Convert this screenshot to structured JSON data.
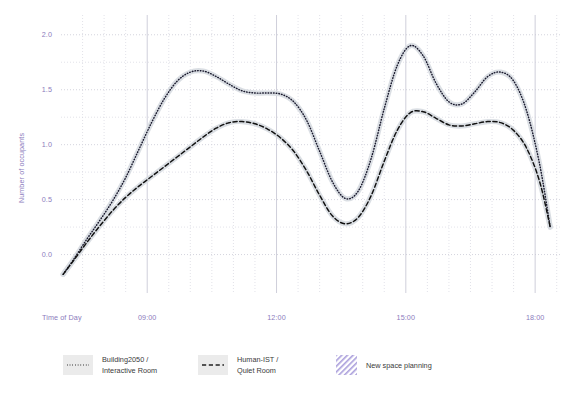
{
  "chart_data": {
    "type": "line",
    "title": "",
    "xlabel": "Time of Day",
    "ylabel": "Number of occupants",
    "xlim": [
      7.0,
      18.6
    ],
    "ylim": [
      -0.35,
      2.18
    ],
    "grid": true,
    "minor_grid": true,
    "xticks": [
      9,
      12,
      15,
      18
    ],
    "xtick_labels": [
      "09:00",
      "12:00",
      "15:00",
      "18:00"
    ],
    "yticks": [
      0.0,
      0.5,
      1.0,
      1.5,
      2.0
    ],
    "ytick_labels": [
      "0.0",
      "0.5",
      "1.0",
      "1.5",
      "2.0"
    ],
    "yticks_minor": [
      0.25,
      0.75,
      1.25,
      1.75
    ],
    "legend_position": "bottom",
    "band_color": "#d9dde3",
    "series": [
      {
        "name": "Building2050 /\nInteractive Room",
        "label_line1": "Building2050 /",
        "label_line2": "Interactive Room",
        "style": "dotted",
        "color": "#1a1a2e",
        "x": [
          7.05,
          7.3,
          7.6,
          7.9,
          8.2,
          8.5,
          8.8,
          9.1,
          9.4,
          9.7,
          10.0,
          10.3,
          10.6,
          10.9,
          11.2,
          11.5,
          11.8,
          12.1,
          12.4,
          12.7,
          13.0,
          13.3,
          13.6,
          13.9,
          14.2,
          14.5,
          14.8,
          15.1,
          15.4,
          15.7,
          16.0,
          16.3,
          16.6,
          16.9,
          17.2,
          17.5,
          17.8,
          18.1,
          18.35
        ],
        "y": [
          -0.18,
          -0.04,
          0.14,
          0.31,
          0.49,
          0.7,
          0.95,
          1.2,
          1.42,
          1.58,
          1.66,
          1.67,
          1.62,
          1.55,
          1.49,
          1.47,
          1.47,
          1.46,
          1.39,
          1.22,
          0.94,
          0.66,
          0.51,
          0.58,
          0.88,
          1.33,
          1.72,
          1.9,
          1.81,
          1.56,
          1.39,
          1.37,
          1.48,
          1.62,
          1.66,
          1.58,
          1.31,
          0.83,
          0.25
        ]
      },
      {
        "name": "Human-IST /\nQuiet Room",
        "label_line1": "Human-IST /",
        "label_line2": "Quiet Room",
        "style": "dashed",
        "color": "#111111",
        "x": [
          7.05,
          7.3,
          7.6,
          7.9,
          8.2,
          8.5,
          8.8,
          9.1,
          9.4,
          9.7,
          10.0,
          10.3,
          10.6,
          10.9,
          11.2,
          11.5,
          11.8,
          12.1,
          12.4,
          12.7,
          13.0,
          13.3,
          13.6,
          13.9,
          14.2,
          14.5,
          14.8,
          15.1,
          15.4,
          15.7,
          16.0,
          16.3,
          16.6,
          16.9,
          17.2,
          17.5,
          17.8,
          18.1,
          18.35
        ],
        "y": [
          -0.18,
          -0.05,
          0.11,
          0.26,
          0.4,
          0.52,
          0.62,
          0.71,
          0.8,
          0.89,
          0.98,
          1.07,
          1.15,
          1.2,
          1.21,
          1.19,
          1.14,
          1.06,
          0.94,
          0.76,
          0.54,
          0.35,
          0.28,
          0.34,
          0.54,
          0.85,
          1.13,
          1.29,
          1.3,
          1.24,
          1.18,
          1.17,
          1.19,
          1.21,
          1.2,
          1.13,
          0.97,
          0.67,
          0.25
        ]
      }
    ],
    "annotations": [
      {
        "name": "New space planning",
        "style": "hatched-swatch",
        "color": "#9b8fd4"
      }
    ]
  },
  "legend": {
    "items": [
      {
        "label_line1": "Building2050 /",
        "label_line2": "Interactive Room",
        "marker": "dotted-line-swatch"
      },
      {
        "label_line1": "Human-IST /",
        "label_line2": "Quiet Room",
        "marker": "dashed-line-swatch"
      },
      {
        "label_line1": "New space planning",
        "label_line2": "",
        "marker": "hatch-swatch"
      }
    ]
  },
  "colors": {
    "axis_text": "#8b7bbd",
    "grid": "#c9c9d6",
    "minor_grid": "#d5d5e0",
    "band": "#d9dde3",
    "series_a": "#1a1a2e",
    "series_b": "#111111",
    "hatch": "#9b8fd4"
  }
}
